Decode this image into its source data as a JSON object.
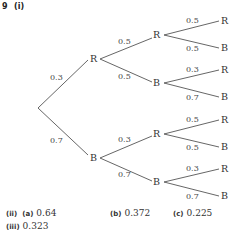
{
  "question": {
    "number": "9",
    "part": "(i)"
  },
  "tree": {
    "root": "",
    "level1": [
      {
        "label": "R",
        "prob": "0.3",
        "children": [
          {
            "label": "R",
            "prob": "0.5",
            "children": [
              {
                "label": "R",
                "prob": "0.5"
              },
              {
                "label": "B",
                "prob": "0.5"
              }
            ]
          },
          {
            "label": "B",
            "prob": "0.5",
            "children": [
              {
                "label": "R",
                "prob": "0.3"
              },
              {
                "label": "B",
                "prob": "0.7"
              }
            ]
          }
        ]
      },
      {
        "label": "B",
        "prob": "0.7",
        "children": [
          {
            "label": "R",
            "prob": "0.3",
            "children": [
              {
                "label": "R",
                "prob": "0.5"
              },
              {
                "label": "B",
                "prob": "0.5"
              }
            ]
          },
          {
            "label": "B",
            "prob": "0.7",
            "children": [
              {
                "label": "R",
                "prob": "0.3"
              },
              {
                "label": "B",
                "prob": "0.7"
              }
            ]
          }
        ]
      }
    ]
  },
  "answers": {
    "ii": {
      "label": "(ii)",
      "a": {
        "label": "(a)",
        "value": "0.64"
      },
      "b": {
        "label": "(b)",
        "value": "0.372"
      },
      "c": {
        "label": "(c)",
        "value": "0.225"
      }
    },
    "iii": {
      "label": "(iii)",
      "value": "0.323"
    }
  }
}
